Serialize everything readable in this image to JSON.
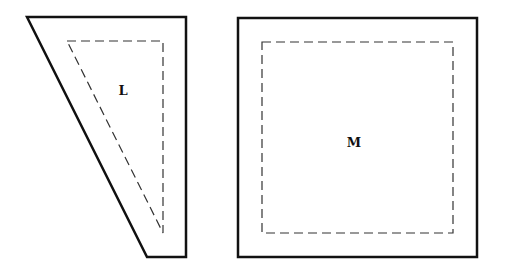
{
  "canvas": {
    "width": 510,
    "height": 267,
    "background": "#ffffff"
  },
  "colors": {
    "outline": "#111111",
    "dashed": "#333333"
  },
  "shapes": [
    {
      "id": "L",
      "label": "L",
      "outer_points": "27,17 186,17 186,257 147,257",
      "inner_points": "67,41 163,41 163,233",
      "label_pos": {
        "x": 123,
        "y": 95
      }
    },
    {
      "id": "M",
      "label": "M",
      "outer_rect": {
        "x": 238,
        "y": 18,
        "w": 239,
        "h": 239
      },
      "inner_rect": {
        "x": 262,
        "y": 42,
        "w": 191,
        "h": 191
      },
      "label_pos": {
        "x": 354,
        "y": 147
      }
    }
  ]
}
